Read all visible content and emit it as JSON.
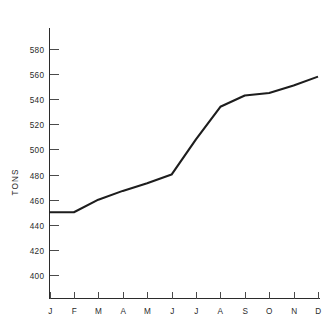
{
  "chart_data": {
    "type": "line",
    "title": "",
    "xlabel": "",
    "ylabel": "TONS",
    "categories": [
      "J",
      "F",
      "M",
      "A",
      "M",
      "J",
      "J",
      "A",
      "S",
      "O",
      "N",
      "D"
    ],
    "values": [
      450,
      450,
      460,
      467,
      473,
      480,
      508,
      534,
      543,
      545,
      551,
      558
    ],
    "series": [
      {
        "name": "TONS",
        "values": [
          450,
          450,
          460,
          467,
          473,
          480,
          508,
          534,
          543,
          545,
          551,
          558
        ]
      }
    ],
    "ylim": [
      390,
      592
    ],
    "y_ticks": [
      400,
      420,
      440,
      460,
      480,
      500,
      520,
      540,
      560,
      580
    ],
    "y_tick_labels": [
      "400",
      "420",
      "440",
      "460",
      "480",
      "500",
      "520",
      "540",
      "560",
      "580"
    ],
    "x_tick_labels": [
      "J",
      "F",
      "M",
      "A",
      "M",
      "J",
      "J",
      "A",
      "S",
      "O",
      "N",
      "D"
    ],
    "grid": false,
    "legend": "none",
    "line_color": "#1d1d1d",
    "axis_color": "#2b2b2b",
    "background_color": "#ffffff"
  }
}
